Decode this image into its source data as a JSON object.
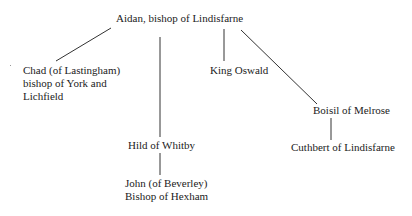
{
  "diagram": {
    "type": "lineage-tree",
    "nodes": {
      "aidan": "Aidan, bishop of Lindisfarne",
      "chad": "Chad (of Lastingham)\nbishop of York and\nLichfield",
      "hild": "Hild of Whitby",
      "oswald": "King Oswald",
      "boisil": "Boisil of Melrose",
      "cuthbert": "Cuthbert of Lindisfarne",
      "john": "John (of Beverley)\nBishop of Hexham"
    },
    "edges": [
      {
        "from": "aidan",
        "to": "chad"
      },
      {
        "from": "aidan",
        "to": "hild"
      },
      {
        "from": "aidan",
        "to": "oswald"
      },
      {
        "from": "aidan",
        "to": "boisil"
      },
      {
        "from": "boisil",
        "to": "cuthbert"
      },
      {
        "from": "hild",
        "to": "john"
      }
    ],
    "line_color": "#333333",
    "text_color": "#222222"
  }
}
